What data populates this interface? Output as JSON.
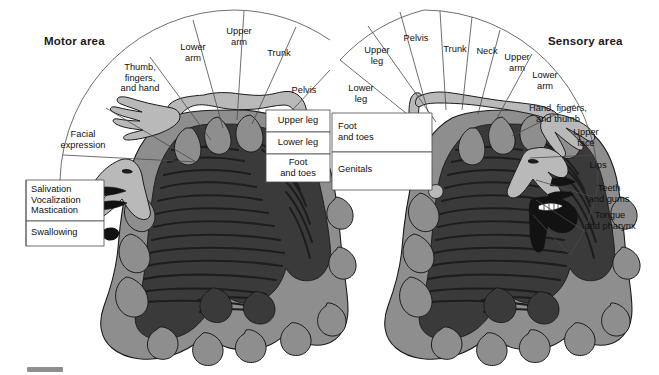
{
  "figure": {
    "background_color": "#ffffff",
    "line_color": "#4a4a4a",
    "text_color": "#111111",
    "cortex_color": "#8e8e8e",
    "white_matter_color": "#3a3a3a",
    "homunculus_color": "#b9b9b9",
    "deep_color": "#121212"
  },
  "motor": {
    "title": "Motor area",
    "wedges": [
      {
        "label": "Lower\narm"
      },
      {
        "label": "Upper\narm"
      },
      {
        "label": "Trunk"
      },
      {
        "label": "Pelvis"
      },
      {
        "label": "Thumb,\nfingers,\nand hand"
      },
      {
        "label": "Facial\nexpression"
      }
    ],
    "boxes": [
      {
        "label": "Upper leg"
      },
      {
        "label": "Lower leg"
      },
      {
        "label": "Foot\nand toes"
      },
      {
        "label": "Salivation\nVocalization\nMastication"
      },
      {
        "label": "Swallowing"
      }
    ]
  },
  "sensory": {
    "title": "Sensory area",
    "wedges": [
      {
        "label": "Pelvis"
      },
      {
        "label": "Trunk"
      },
      {
        "label": "Neck"
      },
      {
        "label": "Upper\narm"
      },
      {
        "label": "Lower\narm"
      },
      {
        "label": "Upper\nleg"
      },
      {
        "label": "Lower\nleg"
      },
      {
        "label": "Hand, fingers,\nand thumb"
      },
      {
        "label": "Upper\nface"
      },
      {
        "label": "Lips"
      },
      {
        "label": "Teeth\nand gums"
      },
      {
        "label": "Tongue\nand pharynx"
      }
    ],
    "boxes": [
      {
        "label": "Foot\nand toes"
      },
      {
        "label": "Genitals"
      }
    ]
  }
}
